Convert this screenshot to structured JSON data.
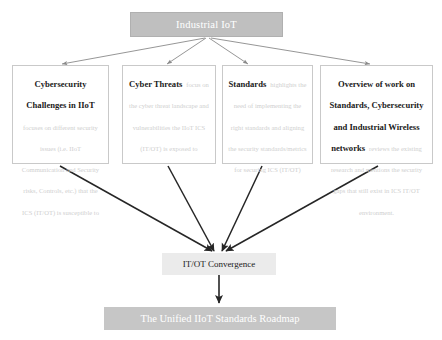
{
  "diagram": {
    "type": "flowchart",
    "title_node": {
      "label": "Industrial IoT",
      "fill": "#bfbfbf",
      "text_color": "#ffffff"
    },
    "branches": [
      {
        "title": "Cybersecurity Challenges in IIoT",
        "body": "focuses on different security issues (i.e. IIoT Communication and Security risks, Controls, etc.) that the ICS (IT/OT) is susceptible to"
      },
      {
        "title": "Cyber Threats",
        "body": "focus on the cyber threat landscape and vulnerabilities the IIoT ICS (IT/OT) is exposed to"
      },
      {
        "title": "Standards",
        "body": "highlights the need of implementing the right standards and aligning the security standards/metrics for securing ICS (IT/OT)"
      },
      {
        "title": "Overview of work on Standards, Cybersecurity and Industrial Wireless networks",
        "body": "reviews the existing research and mentions the security gaps that still exist in ICS IT/OT environment."
      }
    ],
    "convergence_node": {
      "label": "IT/OT Convergence",
      "fill": "#ebebeb",
      "text_color": "#1a1a1a"
    },
    "final_node": {
      "label": "The Unified IIoT Standards Roadmap",
      "fill": "#c6c6c6",
      "text_color": "#ffffff"
    },
    "edge_color": "#595959",
    "box_border_color": "#c9c9c9"
  }
}
